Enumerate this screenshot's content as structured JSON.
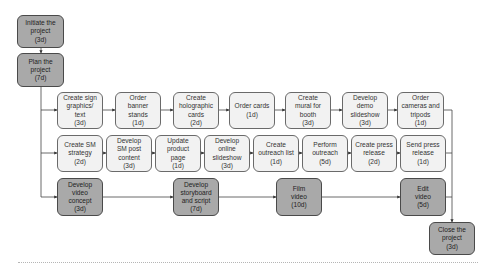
{
  "diagram": {
    "type": "project-network-flowchart",
    "nodes": [
      {
        "id": "initiate",
        "label": "Initiate the\nproject\n(3d)",
        "style": "dark",
        "x": 17,
        "y": 15,
        "w": 47,
        "h": 33
      },
      {
        "id": "plan",
        "label": "Plan the\nproject\n(7d)",
        "style": "dark",
        "x": 17,
        "y": 53,
        "w": 47,
        "h": 34
      },
      {
        "id": "sign",
        "label": "Create sign\ngraphics/\ntext\n(3d)",
        "style": "light",
        "x": 57,
        "y": 92,
        "w": 46,
        "h": 37
      },
      {
        "id": "banner",
        "label": "Order\nbanner\nstands\n(1d)",
        "style": "light",
        "x": 115,
        "y": 92,
        "w": 46,
        "h": 37
      },
      {
        "id": "holo",
        "label": "Create\nholographic\ncards\n(2d)",
        "style": "light",
        "x": 173,
        "y": 92,
        "w": 46,
        "h": 37
      },
      {
        "id": "cards",
        "label": "Order cards\n(1d)",
        "style": "light",
        "x": 229,
        "y": 92,
        "w": 46,
        "h": 37
      },
      {
        "id": "mural",
        "label": "Create\nmural for\nbooth\n(3d)",
        "style": "light",
        "x": 285,
        "y": 92,
        "w": 46,
        "h": 37
      },
      {
        "id": "demo",
        "label": "Develop\ndemo\nslideshow\n(3d)",
        "style": "light",
        "x": 342,
        "y": 92,
        "w": 46,
        "h": 37
      },
      {
        "id": "cameras",
        "label": "Order\ncameras and\ntripods\n(1d)",
        "style": "light",
        "x": 397,
        "y": 92,
        "w": 47,
        "h": 37
      },
      {
        "id": "smstrategy",
        "label": "Create SM\nstrategy\n(2d)",
        "style": "light",
        "x": 57,
        "y": 135,
        "w": 46,
        "h": 37
      },
      {
        "id": "smpost",
        "label": "Develop\nSM post\ncontent\n(3d)",
        "style": "light",
        "x": 106,
        "y": 135,
        "w": 46,
        "h": 37
      },
      {
        "id": "product",
        "label": "Update\nproduct\npage\n(1d)",
        "style": "light",
        "x": 155,
        "y": 135,
        "w": 46,
        "h": 37
      },
      {
        "id": "online",
        "label": "Develop\nonline\nslideshow\n(3d)",
        "style": "light",
        "x": 204,
        "y": 135,
        "w": 46,
        "h": 37
      },
      {
        "id": "outreachlist",
        "label": "Create\noutreach list\n(1d)",
        "style": "light",
        "x": 253,
        "y": 135,
        "w": 46,
        "h": 37
      },
      {
        "id": "outreach",
        "label": "Perform\noutreach\n(5d)",
        "style": "light",
        "x": 302,
        "y": 135,
        "w": 46,
        "h": 37
      },
      {
        "id": "pressrel",
        "label": "Create press\nrelease\n(2d)",
        "style": "light",
        "x": 351,
        "y": 135,
        "w": 46,
        "h": 37
      },
      {
        "id": "sendpress",
        "label": "Send press\nrelease\n(1d)",
        "style": "light",
        "x": 400,
        "y": 135,
        "w": 46,
        "h": 37
      },
      {
        "id": "videoconcept",
        "label": "Develop\nvideo\nconcept\n(3d)",
        "style": "dark",
        "x": 57,
        "y": 178,
        "w": 46,
        "h": 38
      },
      {
        "id": "storyboard",
        "label": "Develop\nstoryboard\nand script\n(7d)",
        "style": "dark",
        "x": 173,
        "y": 178,
        "w": 46,
        "h": 38
      },
      {
        "id": "film",
        "label": "Film\nvideo\n(10d)",
        "style": "dark",
        "x": 276,
        "y": 178,
        "w": 46,
        "h": 38
      },
      {
        "id": "edit",
        "label": "Edit\nvideo\n(5d)",
        "style": "dark",
        "x": 400,
        "y": 178,
        "w": 46,
        "h": 38
      },
      {
        "id": "close",
        "label": "Close the\nproject\n(3d)",
        "style": "dark",
        "x": 429,
        "y": 222,
        "w": 46,
        "h": 33
      }
    ],
    "edges": [
      [
        "initiate",
        "plan"
      ],
      [
        "plan",
        "sign"
      ],
      [
        "plan",
        "smstrategy"
      ],
      [
        "plan",
        "videoconcept"
      ],
      [
        "sign",
        "banner"
      ],
      [
        "banner",
        "holo"
      ],
      [
        "holo",
        "cards"
      ],
      [
        "cards",
        "mural"
      ],
      [
        "mural",
        "demo"
      ],
      [
        "demo",
        "cameras"
      ],
      [
        "smstrategy",
        "smpost"
      ],
      [
        "smpost",
        "product"
      ],
      [
        "product",
        "online"
      ],
      [
        "online",
        "outreachlist"
      ],
      [
        "outreachlist",
        "outreach"
      ],
      [
        "outreach",
        "pressrel"
      ],
      [
        "pressrel",
        "sendpress"
      ],
      [
        "videoconcept",
        "storyboard"
      ],
      [
        "storyboard",
        "film"
      ],
      [
        "film",
        "edit"
      ],
      [
        "cameras",
        "close"
      ],
      [
        "sendpress",
        "close"
      ],
      [
        "edit",
        "close"
      ]
    ],
    "colors": {
      "light_fill": "#f2f2f2",
      "dark_fill": "#a9a9a9",
      "line": "#333333"
    }
  }
}
